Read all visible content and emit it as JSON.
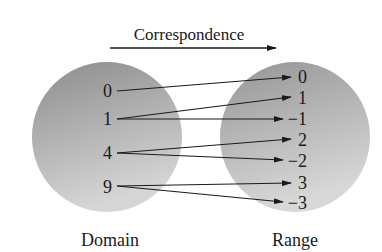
{
  "title": "Correspondence",
  "domain": {
    "label": "Domain",
    "values": [
      "0",
      "1",
      "4",
      "9"
    ]
  },
  "range": {
    "label": "Range",
    "values": [
      "0",
      "1",
      "−1",
      "2",
      "−2",
      "3",
      "−3"
    ]
  },
  "mappings": [
    {
      "from": "0",
      "to": "0"
    },
    {
      "from": "1",
      "to": "1"
    },
    {
      "from": "1",
      "to": "−1"
    },
    {
      "from": "4",
      "to": "2"
    },
    {
      "from": "4",
      "to": "−2"
    },
    {
      "from": "9",
      "to": "3"
    },
    {
      "from": "9",
      "to": "−3"
    }
  ],
  "colors": {
    "circle_dark": "#8f8f8f",
    "circle_light": "#d4d4d4",
    "ink": "#1a1a1a"
  }
}
